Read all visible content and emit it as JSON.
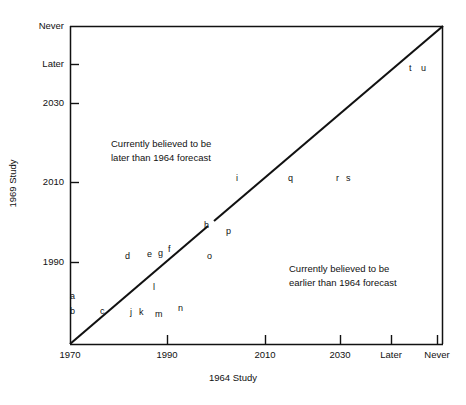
{
  "chart_data": {
    "type": "scatter",
    "title": "",
    "xlabel": "1964 Study",
    "ylabel": "1969 Study",
    "grid": false,
    "legend": null,
    "xticks": [
      "1970",
      "1990",
      "2010",
      "2030",
      "Later",
      "Never"
    ],
    "yticks": [
      "1990",
      "2010",
      "2030",
      "Later",
      "Never"
    ],
    "xlim": [
      "1970",
      "Never"
    ],
    "ylim": [
      "1970",
      "Never"
    ],
    "reference_line": {
      "name": "identity-line",
      "description": "45-degree line where 1969 Study equals 1964 forecast",
      "from": [
        "1970",
        "1970"
      ],
      "to": [
        "Never",
        "Never"
      ]
    },
    "annotations": [
      {
        "name": "upper-left-annotation",
        "line1": "Currently believed to be",
        "line2": "later than 1964 forecast"
      },
      {
        "name": "lower-right-annotation",
        "line1": "Currently believed to be",
        "line2": "earlier than 1964 forecast"
      }
    ],
    "points": [
      {
        "label": "a",
        "x": 1970,
        "y": 1978
      },
      {
        "label": "b",
        "x": 1970,
        "y": 1974
      },
      {
        "label": "c",
        "x": 1976,
        "y": 1974
      },
      {
        "label": "d",
        "x": 1982,
        "y": 1991
      },
      {
        "label": "e",
        "x": 1987,
        "y": 1992
      },
      {
        "label": "f",
        "x": 1991,
        "y": 1993
      },
      {
        "label": "g",
        "x": 1989,
        "y": 1992
      },
      {
        "label": "h",
        "x": 2000,
        "y": 2000
      },
      {
        "label": "i",
        "x": 2006,
        "y": 2011
      },
      {
        "label": "j",
        "x": 1983,
        "y": 1974
      },
      {
        "label": "k",
        "x": 1985,
        "y": 1974
      },
      {
        "label": "l",
        "x": 1988,
        "y": 1981
      },
      {
        "label": "m",
        "x": 1988,
        "y": 1973
      },
      {
        "label": "n",
        "x": 1993,
        "y": 1975
      },
      {
        "label": "o",
        "x": 2000,
        "y": 1991
      },
      {
        "label": "p",
        "x": 2011,
        "y": 1999
      },
      {
        "label": "q",
        "x": 2020,
        "y": 2011
      },
      {
        "label": "r",
        "x": 2030,
        "y": 2011
      },
      {
        "label": "s",
        "x": 2032,
        "y": 2011
      },
      {
        "label": "t",
        "x": 2044,
        "y": 2044
      },
      {
        "label": "u",
        "x": 2047,
        "y": 2044
      }
    ]
  },
  "axes": {
    "x": {
      "title": "1964 Study",
      "ticks": [
        {
          "label": "1970",
          "px": 70
        },
        {
          "label": "1990",
          "px": 167
        },
        {
          "label": "2010",
          "px": 265
        },
        {
          "label": "2030",
          "px": 340
        },
        {
          "label": "Later",
          "px": 391
        },
        {
          "label": "Never",
          "px": 437
        }
      ]
    },
    "y": {
      "title": "1969 Study",
      "ticks": [
        {
          "label": "Never",
          "px": 26
        },
        {
          "label": "Later",
          "px": 64
        },
        {
          "label": "2030",
          "px": 103
        },
        {
          "label": "2010",
          "px": 182
        },
        {
          "label": "1990",
          "px": 262
        }
      ]
    }
  },
  "annotations": {
    "upper_left": {
      "line1": "Currently believed to be",
      "line2": "later than 1964 forecast"
    },
    "lower_right": {
      "line1": "Currently believed to be",
      "line2": "earlier than 1964 forecast"
    }
  },
  "point_labels": [
    {
      "label": "a",
      "px": 70,
      "py": 292
    },
    {
      "label": "b",
      "px": 70,
      "py": 307
    },
    {
      "label": "c",
      "px": 100,
      "py": 307
    },
    {
      "label": "d",
      "px": 125,
      "py": 252
    },
    {
      "label": "e",
      "px": 147,
      "py": 250
    },
    {
      "label": "g",
      "px": 158,
      "py": 249
    },
    {
      "label": "f",
      "px": 168,
      "py": 245
    },
    {
      "label": "j",
      "px": 130,
      "py": 308
    },
    {
      "label": "k",
      "px": 139,
      "py": 308
    },
    {
      "label": "l",
      "px": 153,
      "py": 283
    },
    {
      "label": "m",
      "px": 155,
      "py": 310
    },
    {
      "label": "n",
      "px": 178,
      "py": 304
    },
    {
      "label": "o",
      "px": 207,
      "py": 252
    },
    {
      "label": "h",
      "px": 204,
      "py": 221
    },
    {
      "label": "p",
      "px": 226,
      "py": 227
    },
    {
      "label": "i",
      "px": 236,
      "py": 174
    },
    {
      "label": "q",
      "px": 288,
      "py": 174
    },
    {
      "label": "r",
      "px": 336,
      "py": 174
    },
    {
      "label": "s",
      "px": 346,
      "py": 174
    },
    {
      "label": "t",
      "px": 409,
      "py": 64
    },
    {
      "label": "u",
      "px": 421,
      "py": 64
    }
  ],
  "colors": {
    "ink": "#111111",
    "background": "#ffffff"
  }
}
